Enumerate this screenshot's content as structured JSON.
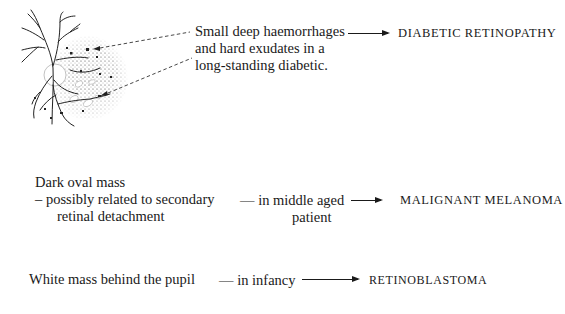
{
  "figure": {
    "illustration": {
      "label": "fundus-drawing",
      "features": [
        "retinal vessels",
        "optic disc",
        "dot haemorrhages",
        "hard exudates",
        "stippled background"
      ]
    },
    "rows": [
      {
        "finding_lines": [
          "Small deep haemorrhages",
          "and hard exudates in a",
          "long-standing diabetic."
        ],
        "qualifier_lines": [],
        "diagnosis": "DIABETIC  RETINOPATHY"
      },
      {
        "finding_lines": [
          "Dark oval mass",
          "– possibly related to secondary",
          "retinal detachment"
        ],
        "qualifier_lines": [
          "— in middle aged",
          "patient"
        ],
        "diagnosis": "MALIGNANT MELANOMA"
      },
      {
        "finding_lines": [
          "White mass behind the pupil"
        ],
        "qualifier_lines": [
          "— in infancy"
        ],
        "diagnosis": "RETINOBLASTOMA"
      }
    ]
  }
}
